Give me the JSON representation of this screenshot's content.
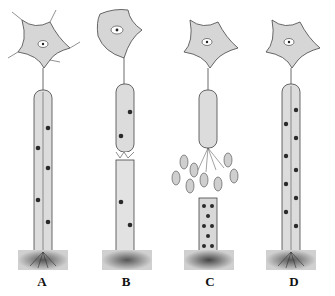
{
  "figure": {
    "title": "",
    "panels": [
      {
        "id": "A",
        "label": "A",
        "state": "normal"
      },
      {
        "id": "B",
        "label": "B",
        "state": "injured-degenerating"
      },
      {
        "id": "C",
        "label": "C",
        "state": "schwann-proliferation"
      },
      {
        "id": "D",
        "label": "D",
        "state": "regenerated"
      }
    ],
    "colors": {
      "cell_body_fill": "#d6d6d6",
      "sheath_fill": "#dcdcdc",
      "nucleus": "#2a2a2a",
      "stroke": "#444444",
      "muscle_band": "#bdbdbd",
      "muscle_center": "#5a5a5a"
    }
  }
}
